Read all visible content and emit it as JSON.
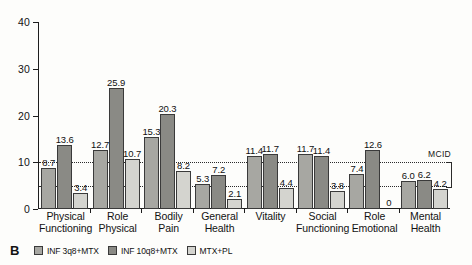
{
  "panel": {
    "label": "B"
  },
  "legend": {
    "items": [
      {
        "name": "INF 3q8+MTX",
        "color": "#a7a7a2"
      },
      {
        "name": "INF 10q8+MTX",
        "color": "#8a8a85"
      },
      {
        "name": "MTX+PL",
        "color": "#d4d4cf"
      }
    ]
  },
  "annotations": {
    "mcid_label": "MCID"
  },
  "chart_data": {
    "type": "bar",
    "title": "",
    "xlabel": "",
    "ylabel": "",
    "ylim": [
      0,
      40
    ],
    "yticks": [
      0,
      10,
      20,
      30,
      40
    ],
    "ytick_labels": [
      "0",
      "10",
      "20",
      "30",
      "40"
    ],
    "grid": false,
    "legend_position": "bottom-left",
    "reference_lines": [
      {
        "value": 10,
        "style": "dotted",
        "label": "MCID"
      },
      {
        "value": 5,
        "style": "dotted",
        "label": "MCID"
      }
    ],
    "categories": [
      "Physical Functioning",
      "Role Physical",
      "Bodily Pain",
      "General Health",
      "Vitality",
      "Social Functioning",
      "Role Emotional",
      "Mental Health"
    ],
    "category_lines": [
      [
        "Physical",
        "Functioning"
      ],
      [
        "Role",
        "Physical"
      ],
      [
        "Bodily",
        "Pain"
      ],
      [
        "General",
        "Health"
      ],
      [
        "Vitality",
        ""
      ],
      [
        "Social",
        "Functioning"
      ],
      [
        "Role",
        "Emotional"
      ],
      [
        "Mental",
        "Health"
      ]
    ],
    "series": [
      {
        "name": "INF 3q8+MTX",
        "color": "#a7a7a2",
        "values": [
          8.7,
          12.7,
          15.3,
          5.3,
          11.4,
          11.7,
          7.4,
          6.0
        ],
        "labels": [
          "8.7",
          "12.7",
          "15.3",
          "5.3",
          "11.4",
          "11.7",
          "7.4",
          "6.0"
        ]
      },
      {
        "name": "INF 10q8+MTX",
        "color": "#8a8a85",
        "values": [
          13.6,
          25.9,
          20.3,
          7.2,
          11.7,
          11.4,
          12.6,
          6.2
        ],
        "labels": [
          "13.6",
          "25.9",
          "20.3",
          "7.2",
          "11.7",
          "11.4",
          "12.6",
          "6.2"
        ]
      },
      {
        "name": "MTX+PL",
        "color": "#d4d4cf",
        "values": [
          3.4,
          10.7,
          8.2,
          2.1,
          4.4,
          3.8,
          0,
          4.2
        ],
        "labels": [
          "3.4",
          "10.7",
          "8.2",
          "2.1",
          "4.4",
          "3.8",
          "0",
          "4.2"
        ]
      }
    ]
  }
}
